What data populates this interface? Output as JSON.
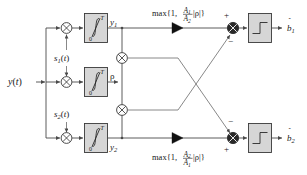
{
  "diagram": {
    "background_color": "#ffffff",
    "block_fill": "#d6d6d6",
    "wire_color": "#4a4a4a",
    "text_color": "#1a1a1a"
  },
  "labels": {
    "input": "y(t)",
    "signature_1": "s₁(t)",
    "signature_2": "s₂(t)",
    "integrator_symbol": "∫",
    "integrator_upper_limit": "T",
    "integrator_lower_limit": "0",
    "output_y1": "y₁",
    "output_y2": "y₂",
    "correlation": "ρ",
    "gain_top": "max{1, (A₁/A₂)|ρ|}",
    "gain_bottom": "max{1, (A₂/A₁)|ρ|}",
    "decision_1": "b̂1",
    "decision_2": "b̂2",
    "multiplier_symbol": "⊗",
    "sum_symbol": "⊕",
    "plus": "+",
    "minus": "−"
  },
  "gain_top_parts": {
    "prefix": "max{1,",
    "numerator": "A",
    "numerator_sub": "1",
    "denominator": "A",
    "denominator_sub": "2",
    "suffix": "|ρ|}"
  },
  "gain_bottom_parts": {
    "prefix": "max{1,",
    "numerator": "A",
    "numerator_sub": "2",
    "denominator": "A",
    "denominator_sub": "1",
    "suffix": "|ρ|}"
  },
  "sum_signs": {
    "top_upper": "+",
    "top_lower": "−",
    "bottom_upper": "−",
    "bottom_lower": "+"
  },
  "blocks": {
    "integrator_1": "integrate-and-dump-1",
    "integrator_rho": "integrate-and-dump-rho",
    "integrator_2": "integrate-and-dump-2",
    "sign_block_1": "sign-decision-1",
    "sign_block_2": "sign-decision-2"
  }
}
